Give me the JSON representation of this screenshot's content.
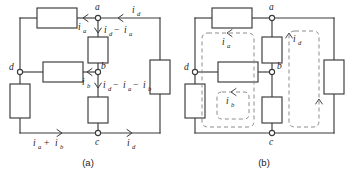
{
  "figure": {
    "type": "circuit-diagram-pair",
    "background_color": "#ffffff",
    "wire_color": "#3a3a3a",
    "loop_color": "#8c8c8c",
    "text_color": "#1c1c1c"
  },
  "panel_a": {
    "caption": "(a)",
    "nodes": [
      {
        "id": "a",
        "label": "a"
      },
      {
        "id": "b",
        "label": "b"
      },
      {
        "id": "c",
        "label": "c"
      },
      {
        "id": "d",
        "label": "d"
      }
    ],
    "resistor_count": 6,
    "current_labels": [
      {
        "id": "i_d_top",
        "base": "i",
        "sub": "d",
        "text": "i_d",
        "direction": "left"
      },
      {
        "id": "i_a_top",
        "base": "i",
        "sub": "a",
        "text": "i_a",
        "direction": "left"
      },
      {
        "id": "i_d_minus_i_a",
        "text": "i_d - i_a",
        "direction": "down"
      },
      {
        "id": "i_b_mid",
        "base": "i",
        "sub": "b",
        "text": "i_b",
        "direction": "left"
      },
      {
        "id": "i_d_minus_i_a_minus_i_b",
        "text": "i_d - i_a - i_b",
        "direction": "down"
      },
      {
        "id": "i_a_plus_i_b",
        "text": "i_a + i_b",
        "direction": "right"
      },
      {
        "id": "i_d_bottom",
        "base": "i",
        "sub": "d",
        "text": "i_d",
        "direction": "right"
      }
    ],
    "expr_top": {
      "first": "i",
      "first_sub": "d",
      "op": "−",
      "second": "i",
      "second_sub": "a"
    },
    "expr_middle": {
      "first": "i",
      "first_sub": "d",
      "op1": "−",
      "second": "i",
      "second_sub": "a",
      "op2": "−",
      "third": "i",
      "third_sub": "b"
    },
    "expr_bottom": {
      "first": "i",
      "first_sub": "a",
      "op": "+",
      "second": "i",
      "second_sub": "b"
    }
  },
  "panel_b": {
    "caption": "(b)",
    "nodes": [
      {
        "id": "a",
        "label": "a"
      },
      {
        "id": "b",
        "label": "b"
      },
      {
        "id": "c",
        "label": "c"
      },
      {
        "id": "d",
        "label": "d"
      }
    ],
    "resistor_count": 6,
    "mesh_loops": [
      {
        "id": "loop-i-a",
        "base": "i",
        "sub": "a",
        "text": "i_a",
        "direction": "counterclockwise"
      },
      {
        "id": "loop-i-b",
        "base": "i",
        "sub": "b",
        "text": "i_b",
        "direction": "counterclockwise"
      },
      {
        "id": "loop-i-d",
        "base": "i",
        "sub": "d",
        "text": "i_d",
        "direction": "clockwise"
      }
    ]
  }
}
